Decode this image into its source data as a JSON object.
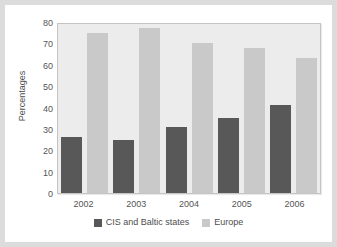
{
  "chart_data": {
    "type": "bar",
    "title": "",
    "xlabel": "",
    "ylabel": "Percentages",
    "categories": [
      "2002",
      "2003",
      "2004",
      "2005",
      "2006"
    ],
    "series": [
      {
        "name": "CIS and Baltic states",
        "color": "#585858",
        "values": [
          26,
          25,
          31,
          35,
          41
        ]
      },
      {
        "name": "Europe",
        "color": "#c9c9c9",
        "values": [
          75,
          77,
          70,
          68,
          63
        ]
      }
    ],
    "ylim": [
      0,
      80
    ],
    "yticks": [
      0,
      10,
      20,
      30,
      40,
      50,
      60,
      70,
      80
    ],
    "ytick_labels": [
      "0",
      "10",
      "20",
      "30",
      "40",
      "50",
      "60",
      "70",
      "80"
    ],
    "grid": false,
    "legend_position": "bottom",
    "plot_background": "#ececec",
    "figure_background": "#ffffff",
    "frame_color": "#dcdcdc"
  }
}
